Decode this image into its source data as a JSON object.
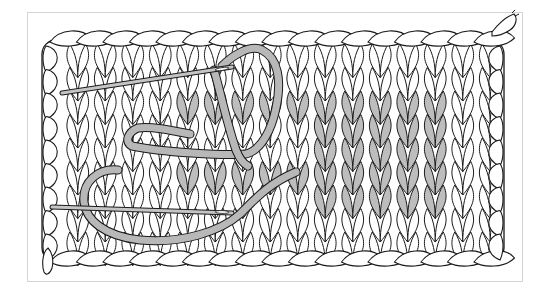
{
  "figure": {
    "colors": {
      "background": "#ffffff",
      "frame_border": "#d4d4d4",
      "line": "#1a1a1a",
      "stitch_fill": "#ffffff",
      "highlight_fill": "#bdbdbd",
      "yarn_fill": "#b8b8b8",
      "needle_fill": "#c4c4c4"
    },
    "swatch": {
      "x": 38,
      "y": 25,
      "width": 470,
      "height": 245,
      "stitch_columns": 16,
      "stitch_rows": 9
    },
    "highlight_blocks": [
      {
        "name": "left-upper-row",
        "col_start": 4,
        "col_end": 8,
        "row": 2
      },
      {
        "name": "left-lower-row",
        "col_start": 4,
        "col_end": 8,
        "row": 5
      },
      {
        "name": "right-motif",
        "col_start": 9,
        "col_end": 13,
        "row_start": 2,
        "row_end": 6
      }
    ],
    "needles": [
      {
        "name": "upper-needle",
        "x1": 62,
        "y1": 93,
        "x2": 232,
        "y2": 67
      },
      {
        "name": "lower-needle",
        "x1": 52,
        "y1": 207,
        "x2": 232,
        "y2": 213
      }
    ]
  }
}
